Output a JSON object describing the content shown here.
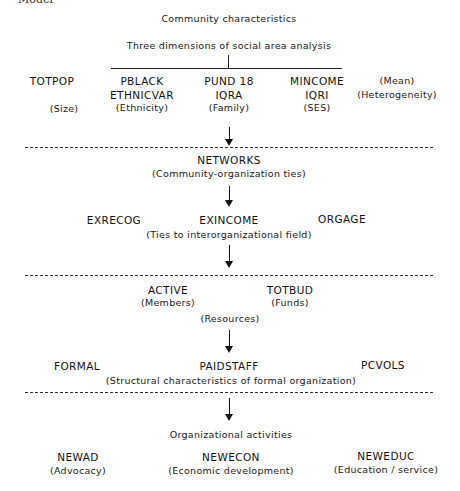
{
  "header": {
    "cut_off_text": "Model",
    "title": "Community characteristics",
    "subtitle": "Three dimensions of social area analysis"
  },
  "level1": {
    "size": {
      "var": "TOTPOP",
      "label": "(Size)"
    },
    "ethnicity": {
      "var1": "PBLACK",
      "var2": "ETHNICVAR",
      "label": "(Ethnicity)"
    },
    "family": {
      "var1": "PUND 18",
      "var2": "IQRA",
      "label": "(Family)"
    },
    "ses": {
      "var1": "MINCOME",
      "var2": "IQRI",
      "label": "(SES)"
    },
    "legend": {
      "mean": "(Mean)",
      "heterogeneity": "(Heterogeneity)"
    }
  },
  "level2": {
    "title": "NETWORKS",
    "label": "(Community-organization ties)"
  },
  "level3": {
    "vars": [
      "EXRECOG",
      "EXINCOME",
      "ORGAGE"
    ],
    "label": "(Ties to interorganizational field)"
  },
  "level4": {
    "active": {
      "var": "ACTIVE",
      "label": "(Members)"
    },
    "totbud": {
      "var": "TOTBUD",
      "label": "(Funds)"
    },
    "label": "(Resources)"
  },
  "level5": {
    "vars": [
      "FORMAL",
      "PAIDSTAFF",
      "PCVOLS"
    ],
    "label": "(Structural characteristics of formal organization)"
  },
  "level6": {
    "title": "Organizational activities",
    "items": [
      {
        "var": "NEWAD",
        "label": "(Advocacy)"
      },
      {
        "var": "NEWECON",
        "label": "(Economic development)"
      },
      {
        "var": "NEWEDUC",
        "label": "(Education / service)"
      }
    ]
  },
  "colors": {
    "ink": "#111111",
    "background": "#ffffff"
  }
}
